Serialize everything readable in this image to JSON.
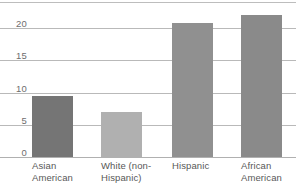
{
  "chart_data": {
    "type": "bar",
    "title": "",
    "subtitle": "",
    "xlabel": "",
    "ylabel": "",
    "categories": [
      "Asian\nAmerican",
      "White (non-\nHispanic)",
      "Hispanic",
      "African\nAmerican"
    ],
    "values": [
      9.4,
      7.0,
      20.8,
      22.0
    ],
    "ylim": [
      0,
      22.8
    ],
    "yticks": [
      0,
      5,
      10,
      15,
      20
    ],
    "ytick_labels": [
      "0",
      "5",
      "10",
      "15",
      "20"
    ],
    "grid": true,
    "grid_axis": "y",
    "legend": false,
    "legend_position": "none",
    "bar_colors": [
      "#757575",
      "#b0b0b0",
      "#909090",
      "#8a8a8a"
    ],
    "background_color": "#ffffff",
    "grid_color": "#b9b9b9",
    "axis_label_color": "#6e6e6e",
    "category_label_color": "#585858"
  },
  "axis": {
    "y_labels": [
      "20",
      "15",
      "10",
      "5",
      "0"
    ]
  }
}
